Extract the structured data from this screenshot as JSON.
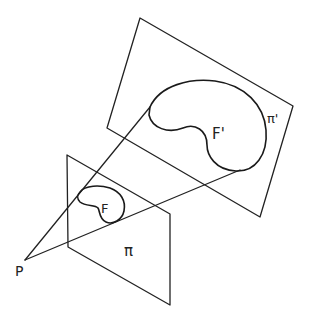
{
  "diagram": {
    "labels": {
      "point": "P",
      "figure": "F",
      "figure_image": "F'",
      "plane": "π",
      "plane_image": "π'"
    },
    "stroke_color": "#222222",
    "background": "#ffffff"
  }
}
